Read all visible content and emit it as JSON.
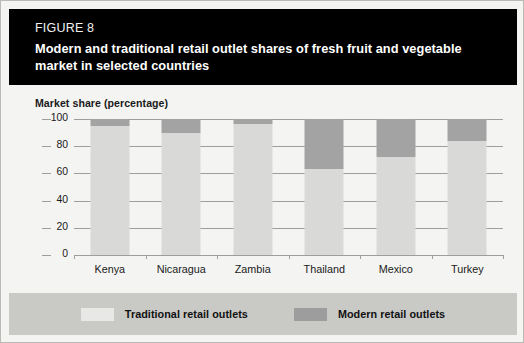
{
  "figure": {
    "number_label": "FIGURE 8",
    "title": "Modern and traditional retail outlet shares of fresh fruit and vegetable market in selected countries"
  },
  "legend": {
    "traditional_label": "Traditional retail outlets",
    "modern_label": "Modern retail outlets"
  },
  "colors": {
    "banner_background": "#000000",
    "card_background": "#f4f4f2",
    "traditional_fill": "#d9d9d7",
    "modern_fill": "#a3a3a3",
    "legend_band": "#c9c9c6",
    "gridline": "#9e9e9b"
  },
  "chart_data": {
    "type": "bar",
    "subtype": "stacked-vertical-100",
    "title": "Modern and traditional retail outlet shares of fresh fruit and vegetable market in selected countries",
    "xlabel": "",
    "ylabel": "Market share (percentage)",
    "ylim": [
      0,
      100
    ],
    "yticks": [
      0,
      20,
      40,
      60,
      80,
      100
    ],
    "ytick_labels": [
      "0",
      "20",
      "40",
      "60",
      "80",
      "100"
    ],
    "grid": true,
    "legend_position": "bottom",
    "categories": [
      "Kenya",
      "Nicaragua",
      "Zambia",
      "Thailand",
      "Mexico",
      "Turkey"
    ],
    "series": [
      {
        "name": "Traditional retail outlets",
        "color": "#d9d9d7",
        "values": [
          95,
          90,
          96,
          63,
          72,
          84
        ]
      },
      {
        "name": "Modern retail outlets",
        "color": "#a3a3a3",
        "values": [
          5,
          10,
          4,
          37,
          28,
          16
        ]
      }
    ]
  }
}
